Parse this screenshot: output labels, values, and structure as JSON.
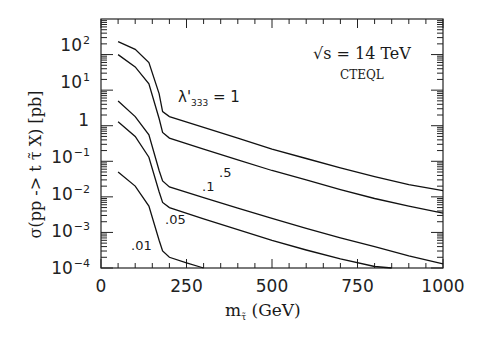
{
  "chart_data": {
    "type": "line",
    "title": "",
    "xlabel": "m_τ̃ (GeV)",
    "xlabel_main": "m",
    "xlabel_sub": "τ̃",
    "xlabel_unit": "(GeV)",
    "ylabel": "σ(pp -> t τ̃ X) [pb]",
    "xlim": [
      0,
      1000
    ],
    "ylim": [
      0.0001,
      1000
    ],
    "yscale": "log",
    "grid": false,
    "x_ticks": [
      "0",
      "250",
      "500",
      "750",
      "1000"
    ],
    "y_ticks": [
      {
        "base": "10",
        "exp": "2"
      },
      {
        "base": "10",
        "exp": "1"
      },
      {
        "base": "1",
        "exp": ""
      },
      {
        "base": "10",
        "exp": "−1"
      },
      {
        "base": "10",
        "exp": "−2"
      },
      {
        "base": "10",
        "exp": "−3"
      },
      {
        "base": "10",
        "exp": "−4"
      }
    ],
    "annotations": {
      "energy": "√s = 14 TeV",
      "pdf": "CTEQL",
      "lambda_label": "λ'",
      "lambda_sub": "333",
      "lambda_eq": "= 1"
    },
    "series": [
      {
        "name": "λ'333 = 1",
        "label": "",
        "x": [
          50,
          100,
          140,
          170,
          180,
          200,
          300,
          400,
          500,
          600,
          700,
          800,
          900,
          1000
        ],
        "y": [
          230,
          140,
          60,
          8,
          2.5,
          1.8,
          0.9,
          0.45,
          0.22,
          0.12,
          0.065,
          0.037,
          0.022,
          0.015
        ]
      },
      {
        "name": "λ'333 = .5",
        "label": ".5",
        "x": [
          50,
          100,
          140,
          170,
          180,
          200,
          300,
          400,
          500,
          600,
          700,
          800,
          900,
          1000
        ],
        "y": [
          100,
          45,
          15,
          1.6,
          0.65,
          0.45,
          0.22,
          0.11,
          0.055,
          0.03,
          0.016,
          0.009,
          0.0055,
          0.0035
        ]
      },
      {
        "name": "λ'333 = .1",
        "label": ".1",
        "x": [
          50,
          100,
          140,
          170,
          180,
          200,
          300,
          400,
          500,
          600,
          700,
          800,
          900,
          1000
        ],
        "y": [
          5,
          1.8,
          0.55,
          0.055,
          0.028,
          0.019,
          0.0095,
          0.0048,
          0.0025,
          0.0013,
          0.0007,
          0.0004,
          0.00022,
          0.00013
        ]
      },
      {
        "name": "λ'333 = .05",
        "label": ".05",
        "x": [
          50,
          100,
          140,
          170,
          180,
          200,
          300,
          400,
          500,
          600,
          700,
          800,
          850
        ],
        "y": [
          1.3,
          0.5,
          0.13,
          0.014,
          0.007,
          0.005,
          0.0024,
          0.0012,
          0.0006,
          0.00032,
          0.00018,
          0.00011,
          0.0001
        ]
      },
      {
        "name": "λ'333 = .01",
        "label": ".01",
        "x": [
          50,
          100,
          140,
          170,
          180,
          200,
          250,
          300
        ],
        "y": [
          0.05,
          0.02,
          0.0055,
          0.0006,
          0.0003,
          0.0002,
          0.00014,
          0.0001
        ]
      }
    ]
  }
}
